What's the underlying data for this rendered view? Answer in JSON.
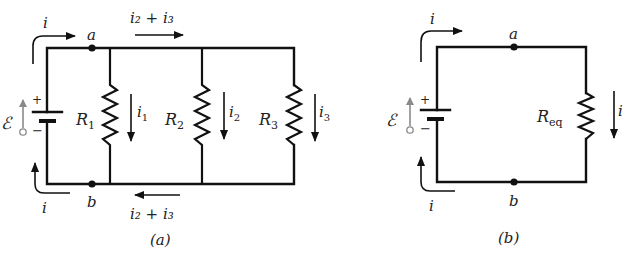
{
  "figure_a": {
    "caption": "(a)",
    "node_top": "a",
    "node_bottom": "b",
    "emf_symbol": "ℰ",
    "plus": "+",
    "minus": "−",
    "current_source_top": "i",
    "current_source_bottom": "i",
    "current_top_branch": "i₂ + i₃",
    "current_bottom_branch": "i₂ + i₃",
    "resistors": [
      {
        "name": "R",
        "sub": "1",
        "current": "i",
        "current_sub": "1"
      },
      {
        "name": "R",
        "sub": "2",
        "current": "i",
        "current_sub": "2"
      },
      {
        "name": "R",
        "sub": "3",
        "current": "i",
        "current_sub": "3"
      }
    ]
  },
  "figure_b": {
    "caption": "(b)",
    "node_top": "a",
    "node_bottom": "b",
    "emf_symbol": "ℰ",
    "plus": "+",
    "minus": "−",
    "current_source_top": "i",
    "current_source_bottom": "i",
    "resistor": {
      "name": "R",
      "sub": "eq",
      "current": "i"
    }
  },
  "colors": {
    "line": "#111111",
    "emf_arrow": "#8a8a8a",
    "background": "#ffffff"
  }
}
